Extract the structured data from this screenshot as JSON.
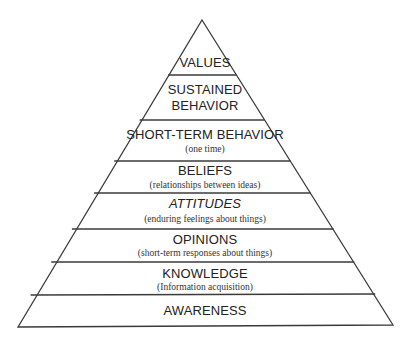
{
  "diagram": {
    "type": "pyramid",
    "stroke_color": "#3a3a3a",
    "text_color": "#222222",
    "levels": [
      {
        "title_lines": [
          "VALUES"
        ],
        "subtitle": ""
      },
      {
        "title_lines": [
          "SUSTAINED",
          "BEHAVIOR"
        ],
        "subtitle": ""
      },
      {
        "title_lines": [
          "SHORT-TERM BEHAVIOR"
        ],
        "subtitle": "(one time)"
      },
      {
        "title_lines": [
          "BELIEFS"
        ],
        "subtitle": "(relationships between ideas)"
      },
      {
        "title_lines": [
          "ATTITUDES"
        ],
        "subtitle": "(enduring feelings about things)",
        "italic": true
      },
      {
        "title_lines": [
          "OPINIONS"
        ],
        "subtitle": "(short-term responses about things)"
      },
      {
        "title_lines": [
          "KNOWLEDGE"
        ],
        "subtitle": "(Information acquisition)"
      },
      {
        "title_lines": [
          "AWARENESS"
        ],
        "subtitle": ""
      }
    ]
  }
}
